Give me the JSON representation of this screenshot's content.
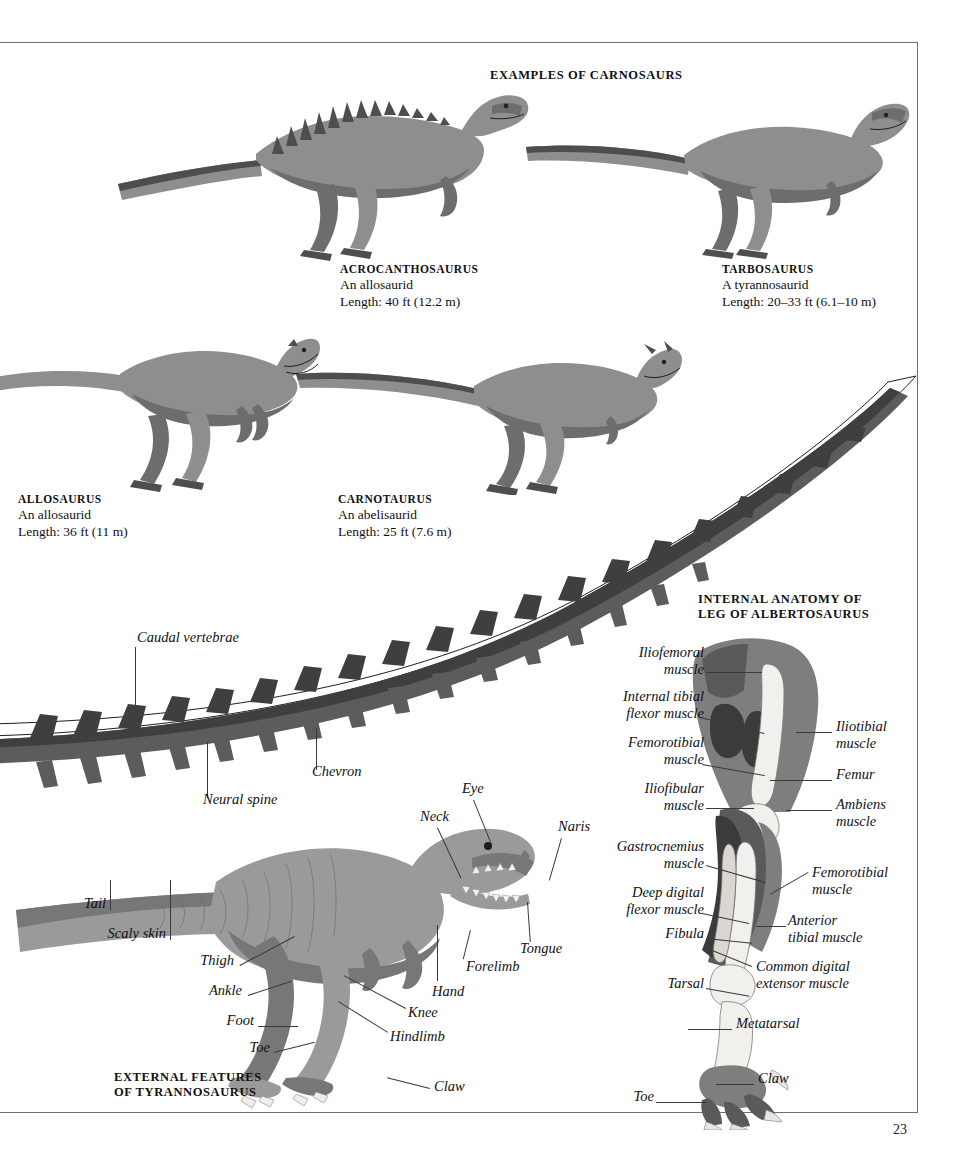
{
  "page": {
    "number": "23",
    "background": "#ffffff",
    "ink": "#111111"
  },
  "sections": {
    "carnosaurs_title": "EXAMPLES OF CARNOSAURS",
    "internal_anatomy_title": "INTERNAL ANATOMY OF\nLEG OF ALBERTOSAURUS",
    "internal_anatomy_title_line1": "INTERNAL ANATOMY OF",
    "internal_anatomy_title_line2": "LEG OF ALBERTOSAURUS",
    "external_features_title_line1": "EXTERNAL FEATURES",
    "external_features_title_line2": "OF TYRANNOSAURUS"
  },
  "specimens": [
    {
      "name": "ACROCANTHOSAURUS",
      "group": "An allosaurid",
      "length": "Length: 40 ft (12.2 m)"
    },
    {
      "name": "TARBOSAURUS",
      "group": "A tyrannosaurid",
      "length": "Length: 20–33 ft (6.1–10 m)"
    },
    {
      "name": "ALLOSAURUS",
      "group": "An allosaurid",
      "length": "Length: 36 ft (11 m)"
    },
    {
      "name": "CARNOTAURUS",
      "group": "An abelisaurid",
      "length": "Length: 25 ft (7.6 m)"
    }
  ],
  "tail_labels": {
    "caudal_vertebrae": "Caudal vertebrae",
    "neural_spine": "Neural  spine",
    "chevron": "Chevron"
  },
  "external_labels": {
    "eye": "Eye",
    "neck": "Neck",
    "naris": "Naris",
    "tongue": "Tongue",
    "forelimb": "Forelimb",
    "hand": "Hand",
    "knee": "Knee",
    "hindlimb": "Hindlimb",
    "thigh": "Thigh",
    "ankle": "Ankle",
    "foot": "Foot",
    "toe": "Toe",
    "claw": "Claw",
    "tail": "Tail",
    "scaly_skin": "Scaly skin"
  },
  "leg_labels": {
    "iliofemoral_muscle_l1": "Iliofemoral",
    "iliofemoral_muscle_l2": "muscle",
    "internal_tibial_l1": "Internal tibial",
    "internal_tibial_l2": "flexor muscle",
    "femorotibial_left_l1": "Femorotibial",
    "femorotibial_left_l2": "muscle",
    "iliofibular_l1": "Iliofibular",
    "iliofibular_l2": "muscle",
    "gastrocnemius_l1": "Gastrocnemius",
    "gastrocnemius_l2": "muscle",
    "deep_digital_l1": "Deep digital",
    "deep_digital_l2": "flexor muscle",
    "fibula": "Fibula",
    "tarsal": "Tarsal",
    "toe": "Toe",
    "iliotibial_l1": "Iliotibial",
    "iliotibial_l2": "muscle",
    "femur": "Femur",
    "ambiens_l1": "Ambiens",
    "ambiens_l2": "muscle",
    "femorotibial_right_l1": "Femorotibial",
    "femorotibial_right_l2": "muscle",
    "anterior_tibial_l1": "Anterior",
    "anterior_tibial_l2": "tibial muscle",
    "common_digital_l1": "Common digital",
    "common_digital_l2": "extensor muscle",
    "metatarsal": "Metatarsal",
    "claw": "Claw"
  }
}
